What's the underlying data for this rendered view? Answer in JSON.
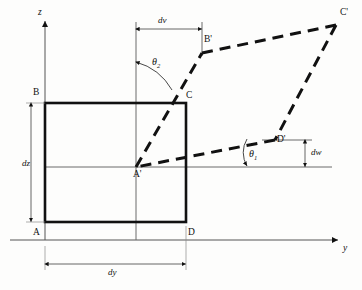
{
  "figure": {
    "type": "geometry-diagram",
    "background_color": "#fdfdfc",
    "line_color": "#111111",
    "axes": {
      "vertical": {
        "label": "z",
        "x": 45,
        "y_top": 20,
        "y_bottom": 240
      },
      "horizontal": {
        "label": "y",
        "y": 240,
        "x_left": 10,
        "x_right": 340
      }
    },
    "points": [
      {
        "name": "A",
        "label": "A",
        "x": 45,
        "y": 222
      },
      {
        "name": "B",
        "label": "B",
        "x": 45,
        "y": 103
      },
      {
        "name": "C",
        "label": "C",
        "x": 186,
        "y": 103
      },
      {
        "name": "D",
        "label": "D",
        "x": 186,
        "y": 222
      },
      {
        "name": "Ap",
        "label": "A'",
        "x": 136,
        "y": 167
      },
      {
        "name": "Bp",
        "label": "B'",
        "x": 202,
        "y": 53
      },
      {
        "name": "Cp",
        "label": "C'",
        "x": 335,
        "y": 25
      },
      {
        "name": "Dp",
        "label": "D'",
        "x": 275,
        "y": 140
      }
    ],
    "dimensions": [
      {
        "name": "dz",
        "label": "dz",
        "orientation": "vertical",
        "x": 31,
        "y_from": 103,
        "y_to": 222
      },
      {
        "name": "dy",
        "label": "dy",
        "orientation": "horizontal",
        "y": 264,
        "x_from": 45,
        "x_to": 186
      },
      {
        "name": "dv",
        "label": "dv",
        "orientation": "horizontal",
        "y": 29,
        "x_from": 136,
        "x_to": 202
      },
      {
        "name": "dw",
        "label": "dw",
        "orientation": "vertical",
        "x": 305,
        "y_from": 140,
        "y_to": 167
      }
    ],
    "angles": [
      {
        "name": "theta1",
        "label": "θ1",
        "symbol": "θ",
        "subscript": "1",
        "x": 250,
        "y": 155,
        "between": "horizontal reference line and deformed edge A'D'"
      },
      {
        "name": "theta2",
        "label": "θ2",
        "symbol": "θ",
        "subscript": "2",
        "x": 158,
        "y": 63,
        "between": "vertical reference line and deformed edge A'B'"
      }
    ],
    "shapes": {
      "undeformed_rectangle": {
        "name": "ABCD",
        "x": 45,
        "y": 103,
        "width": 141,
        "height": 119,
        "stroke": "#111111",
        "stroke_width": 2.4,
        "style": "solid"
      },
      "deformed_parallelogram": {
        "name": "A'B'C'D'",
        "style": "dashed",
        "stroke": "#111111",
        "stroke_width": 3
      }
    }
  }
}
